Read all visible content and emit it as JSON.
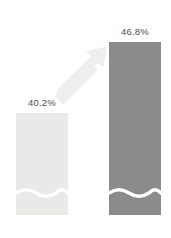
{
  "chart_data": {
    "type": "bar",
    "title": "",
    "subtitle": "",
    "xlabel": "",
    "ylabel": "",
    "grid": false,
    "legend": null,
    "axis_visible": false,
    "value_suffix": "%",
    "categories": [
      "",
      ""
    ],
    "values": [
      40.2,
      46.8
    ],
    "ylim": [
      0,
      50
    ],
    "series": [
      {
        "name": "",
        "values": [
          40.2,
          46.8
        ],
        "labels": [
          "40.2%",
          "46.8%"
        ]
      }
    ],
    "bars": [
      {
        "id": "bar-1",
        "label": "40.2%",
        "value": 40.2,
        "color": "#e9e9e7",
        "x": 16,
        "y": 113,
        "width": 52,
        "height": 102,
        "wave_y": 192
      },
      {
        "id": "bar-2",
        "label": "46.8%",
        "value": 46.8,
        "color": "#8b8b8b",
        "x": 109,
        "y": 42,
        "width": 52,
        "height": 173,
        "wave_y": 192
      }
    ],
    "annotations": [
      {
        "id": "growth-arrow",
        "type": "arrow",
        "direction": "up-right",
        "color": "#eeeeec",
        "from": [
          57,
          101
        ],
        "to": [
          106,
          47
        ],
        "label": ""
      },
      {
        "id": "wave-divider-1",
        "type": "wave-line",
        "color": "#ffffff",
        "bar": "bar-1",
        "y": 192
      },
      {
        "id": "wave-divider-2",
        "type": "wave-line",
        "color": "#ffffff",
        "bar": "bar-2",
        "y": 192
      }
    ],
    "colors": {
      "background": "#ffffff",
      "bar_light": "#e9e9e7",
      "bar_dark": "#8b8b8b",
      "arrow": "#eeeeec",
      "wave": "#ffffff",
      "label_text": "#4d4d4d"
    }
  }
}
